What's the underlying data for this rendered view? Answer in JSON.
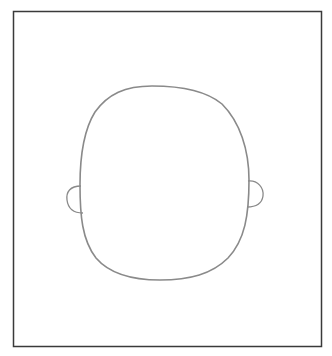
{
  "drawing": {
    "subject": "blank face outline with ears",
    "colors": {
      "frame": "#3a3a3a",
      "outline": "#8a8a8a",
      "background": "#ffffff"
    }
  }
}
